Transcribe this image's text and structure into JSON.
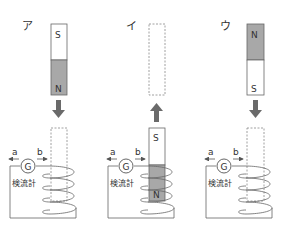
{
  "colors": {
    "line": "#555555",
    "magnet_gray": "#a8a8a8",
    "arrow": "#6a6a6a",
    "dashed": "#888888"
  },
  "panels": [
    {
      "label": "ア",
      "top": {
        "type": "magnet",
        "top_pole": "S",
        "bottom_pole": "N",
        "shaded": "bottom"
      },
      "arrow": "down",
      "bottom": {
        "type": "empty-dashed"
      },
      "galvanometer": {
        "symbol": "G",
        "caption": "検流計",
        "left_label": "a",
        "right_label": "b"
      }
    },
    {
      "label": "イ",
      "top": {
        "type": "empty-dashed"
      },
      "arrow": "up",
      "bottom": {
        "type": "magnet",
        "top_pole": "S",
        "bottom_pole": "N",
        "shaded": "bottom"
      },
      "galvanometer": {
        "symbol": "G",
        "caption": "検流計",
        "left_label": "a",
        "right_label": "b"
      }
    },
    {
      "label": "ウ",
      "top": {
        "type": "magnet",
        "top_pole": "N",
        "bottom_pole": "S",
        "shaded": "top"
      },
      "arrow": "down",
      "bottom": {
        "type": "empty-dashed"
      },
      "galvanometer": {
        "symbol": "G",
        "caption": "検流計",
        "left_label": "a",
        "right_label": "b"
      }
    }
  ]
}
